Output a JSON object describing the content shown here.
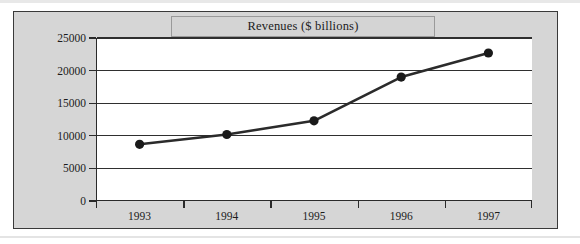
{
  "figure": {
    "title": "Revenues ($ billions)",
    "background_color": "#d6d6d6",
    "plot_background_color": "#ffffff",
    "border_color": "#3a3a3a",
    "line_color": "#2b2b2b",
    "marker_color": "#1a1a1a"
  },
  "chart_data": {
    "type": "line",
    "title": "Revenues ($ billions)",
    "xlabel": "",
    "ylabel": "",
    "categories": [
      "1993",
      "1994",
      "1995",
      "1996",
      "1997"
    ],
    "values": [
      8700,
      10200,
      12300,
      19000,
      22700
    ],
    "series": [
      {
        "name": "Revenues",
        "values": [
          8700,
          10200,
          12300,
          19000,
          22700
        ]
      }
    ],
    "ylim": [
      0,
      25000
    ],
    "ytick_labels": [
      "25000",
      "20000",
      "15000",
      "10000",
      "5000",
      "0"
    ],
    "ytick_values": [
      25000,
      20000,
      15000,
      10000,
      5000,
      0
    ],
    "xtick_labels": [
      "1993",
      "1994",
      "1995",
      "1996",
      "1997"
    ],
    "grid": true,
    "grid_axis": "y",
    "legend": false,
    "markers": "filled-circle"
  }
}
